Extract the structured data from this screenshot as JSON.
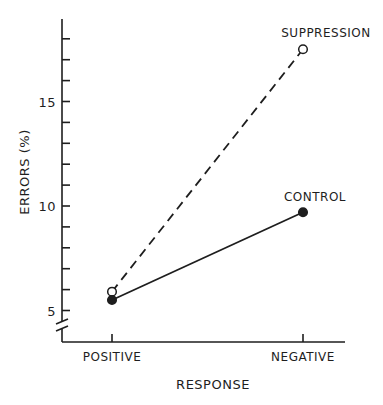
{
  "chart_data": {
    "type": "line",
    "title": "",
    "xlabel": "RESPONSE",
    "ylabel": "ERRORS (%)",
    "categories": [
      "POSITIVE",
      "NEGATIVE"
    ],
    "series": [
      {
        "name": "SUPPRESSION",
        "values": [
          5.9,
          17.5
        ],
        "line_style": "dashed",
        "marker": "open-circle"
      },
      {
        "name": "CONTROL",
        "values": [
          5.5,
          9.7
        ],
        "line_style": "solid",
        "marker": "filled-circle"
      }
    ],
    "ylim": [
      4,
      18.9
    ],
    "yticks_major": [
      5,
      10,
      15
    ],
    "ytick_labels": [
      "5",
      "10",
      "15"
    ],
    "yticks_minor_step": 1,
    "y_axis_break": true,
    "grid": false,
    "legend": "inline labels at line ends"
  },
  "colors": {
    "ink": "#1e1e1e",
    "background": "#ffffff"
  }
}
